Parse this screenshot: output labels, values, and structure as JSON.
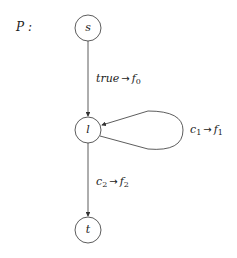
{
  "diagram": {
    "title": "P :",
    "nodes": [
      {
        "id": "s",
        "label": "s",
        "cx": 88,
        "cy": 28,
        "r": 13
      },
      {
        "id": "l",
        "label": "l",
        "cx": 88,
        "cy": 130,
        "r": 13
      },
      {
        "id": "t",
        "label": "t",
        "cx": 88,
        "cy": 230,
        "r": 13
      }
    ],
    "edges": [
      {
        "from": "s",
        "to": "l",
        "guard": "true",
        "guard_sub": "",
        "fn": "f",
        "fn_sub": "0"
      },
      {
        "from": "l",
        "to": "l",
        "guard": "c",
        "guard_sub": "1",
        "fn": "f",
        "fn_sub": "1"
      },
      {
        "from": "l",
        "to": "t",
        "guard": "c",
        "guard_sub": "2",
        "fn": "f",
        "fn_sub": "2"
      }
    ],
    "arrow_symbol": "→",
    "colors": {
      "stroke": "#333333",
      "text": "#222222",
      "background": "#ffffff"
    }
  }
}
